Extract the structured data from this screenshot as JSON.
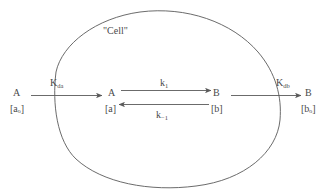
{
  "diagram": {
    "stroke_color": "#5a5a5a",
    "text_color": "#4a4a4a",
    "background_color": "#ffffff",
    "cell_label": "\"Cell\"",
    "outside_left": {
      "species": "A",
      "concentration": "[aₒ]"
    },
    "inside_left": {
      "species": "A",
      "concentration": "[a]"
    },
    "inside_right": {
      "species": "B",
      "concentration": "[b]"
    },
    "outside_right": {
      "species": "B",
      "concentration": "[bₒ]"
    },
    "rate_constants": {
      "influx": "K",
      "influx_sub": "da",
      "forward": "k",
      "forward_sub": "1",
      "reverse": "k",
      "reverse_sub": "−1",
      "efflux": "K",
      "efflux_sub": "db"
    }
  }
}
